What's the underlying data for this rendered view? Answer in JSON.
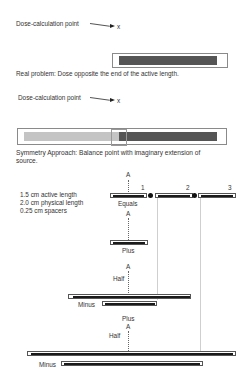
{
  "panel1": {
    "point_label": "Dose-calculation point",
    "point_marker": "x",
    "caption": "Real problem: Dose opposite the end of the active length."
  },
  "panel2": {
    "point_label": "Dose-calculation point",
    "point_marker": "x",
    "caption": "Symmetry Approach: Balance point with imaginary extension of source."
  },
  "panel3": {
    "specs": [
      "1.5 cm active length",
      "2.0 cm physical length",
      "0.25 cm spacers"
    ],
    "axis_label": "A",
    "seed_numbers": [
      "1",
      "2",
      "3"
    ],
    "rows": {
      "equals": "Equals",
      "plus1": "Plus",
      "half1": "Half",
      "minus1": "Minus",
      "plus2": "Plus",
      "half2": "Half",
      "minus2": "Minus"
    }
  },
  "colors": {
    "active_dark": "#555555",
    "active_light": "#c4c4c4",
    "seed_core": "#1a1a1a",
    "outline": "#8a8a8a"
  }
}
